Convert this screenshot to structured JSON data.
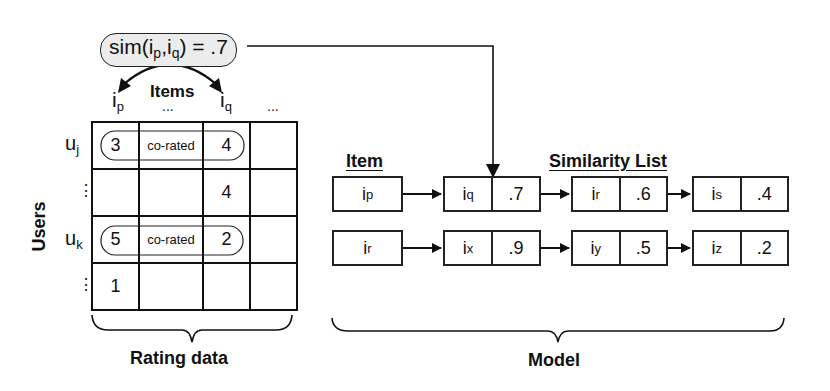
{
  "similarity_label": {
    "text": "sim(i",
    "sub1": "p",
    "mid": ",i",
    "sub2": "q",
    "end": ") = .7"
  },
  "items_axis": {
    "title": "Items",
    "columns": [
      {
        "base": "i",
        "sub": "p"
      },
      {
        "base": "...",
        "sub": ""
      },
      {
        "base": "i",
        "sub": "q"
      },
      {
        "base": "...",
        "sub": ""
      }
    ]
  },
  "users_axis": {
    "title": "Users",
    "rows": [
      {
        "base": "u",
        "sub": "j"
      },
      {
        "base": "⋮",
        "sub": ""
      },
      {
        "base": "u",
        "sub": "k"
      },
      {
        "base": "⋮",
        "sub": ""
      }
    ]
  },
  "rating_grid": {
    "cells": [
      [
        "3",
        "co-rated",
        "4",
        ""
      ],
      [
        "",
        "",
        "4",
        ""
      ],
      [
        "5",
        "co-rated",
        "2",
        ""
      ],
      [
        "1",
        "",
        "",
        ""
      ]
    ]
  },
  "rating_caption": "Rating data",
  "model": {
    "item_header": "Item",
    "list_header": "Similarity List",
    "caption": "Model",
    "rows": [
      {
        "item": {
          "base": "i",
          "sub": "p"
        },
        "list": [
          {
            "base": "i",
            "sub": "q",
            "sim": ".7"
          },
          {
            "base": "i",
            "sub": "r",
            "sim": ".6"
          },
          {
            "base": "i",
            "sub": "s",
            "sim": ".4"
          }
        ]
      },
      {
        "item": {
          "base": "i",
          "sub": "r"
        },
        "list": [
          {
            "base": "i",
            "sub": "x",
            "sim": ".9"
          },
          {
            "base": "i",
            "sub": "y",
            "sim": ".5"
          },
          {
            "base": "i",
            "sub": "z",
            "sim": ".2"
          }
        ]
      }
    ]
  }
}
